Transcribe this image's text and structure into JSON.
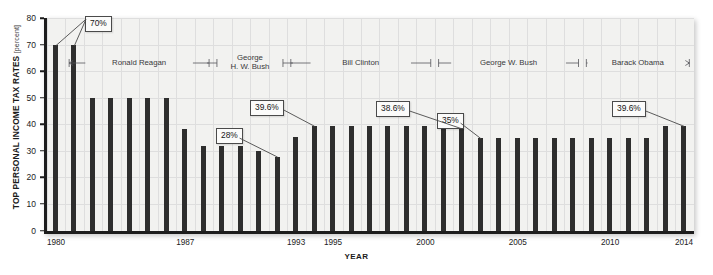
{
  "chart_data": {
    "type": "bar",
    "title": "",
    "xlabel": "YEAR",
    "ylabel": "TOP PERSONAL INCOME TAX RATES",
    "ylabel_unit": "[percent]",
    "ylim": [
      0,
      80
    ],
    "ytick_values": [
      0,
      10,
      20,
      30,
      40,
      50,
      60,
      70,
      80
    ],
    "xtick_labels": [
      "1980",
      "1987",
      "1993",
      "1995",
      "2000",
      "2005",
      "2010",
      "2014"
    ],
    "grid": true,
    "legend": "none",
    "bar_color": "#2e2e2e",
    "plot_background": "#f2f2f0",
    "categories": [
      "1980",
      "1981",
      "1982",
      "1983",
      "1984",
      "1985",
      "1986",
      "1987",
      "1988",
      "1989",
      "1990",
      "1991",
      "1992",
      "1993",
      "1994",
      "1995",
      "1996",
      "1997",
      "1998",
      "1999",
      "2000",
      "2001",
      "2002",
      "2003",
      "2004",
      "2005",
      "2006",
      "2007",
      "2008",
      "2009",
      "2010",
      "2011",
      "2012",
      "2013",
      "2014"
    ],
    "values": [
      70,
      70,
      50,
      50,
      50,
      50,
      50,
      38.5,
      31.9,
      31.9,
      31.9,
      30,
      28,
      35.5,
      39.6,
      39.6,
      39.6,
      39.6,
      39.6,
      39.6,
      39.6,
      39.1,
      38.6,
      35,
      35,
      35,
      35,
      35,
      35,
      35,
      35,
      35,
      35,
      39.6,
      39.6
    ],
    "annotations": [
      {
        "label": "70%",
        "targets": [
          "1980",
          "1981"
        ]
      },
      {
        "label": "28%",
        "targets": [
          "1992"
        ]
      },
      {
        "label": "39.6%",
        "targets": [
          "1994"
        ]
      },
      {
        "label": "38.6%",
        "targets": [
          "2002"
        ]
      },
      {
        "label": "35%",
        "targets": [
          "2003"
        ]
      },
      {
        "label": "39.6%",
        "targets": [
          "2014"
        ]
      }
    ],
    "period_spans": [
      {
        "label": "Ronald Reagan",
        "start": "1981",
        "end": "1988"
      },
      {
        "label": "George\nH. W. Bush",
        "start": "1989",
        "end": "1992"
      },
      {
        "label": "Bill Clinton",
        "start": "1993",
        "end": "2000"
      },
      {
        "label": "George W. Bush",
        "start": "2001",
        "end": "2008"
      },
      {
        "label": "Barack Obama",
        "start": "2009",
        "end": "2014"
      }
    ]
  },
  "axes": {
    "y_ticks": [
      "80",
      "70",
      "60",
      "50",
      "40",
      "30",
      "20",
      "10",
      "0"
    ],
    "x_ticks": [
      "1980",
      "1987",
      "1993",
      "1995",
      "2000",
      "2005",
      "2010",
      "2014"
    ],
    "y_title": "TOP PERSONAL INCOME TAX RATES",
    "y_title_unit": "[percent]",
    "x_title": "YEAR"
  },
  "callouts": [
    {
      "text": "70%"
    },
    {
      "text": "28%"
    },
    {
      "text": "39.6%"
    },
    {
      "text": "38.6%"
    },
    {
      "text": "35%"
    },
    {
      "text": "39.6%"
    }
  ],
  "periods": [
    {
      "line1": "Ronald Reagan",
      "line2": ""
    },
    {
      "line1": "George",
      "line2": "H. W. Bush"
    },
    {
      "line1": "Bill Clinton",
      "line2": ""
    },
    {
      "line1": "George W. Bush",
      "line2": ""
    },
    {
      "line1": "Barack Obama",
      "line2": ""
    }
  ]
}
